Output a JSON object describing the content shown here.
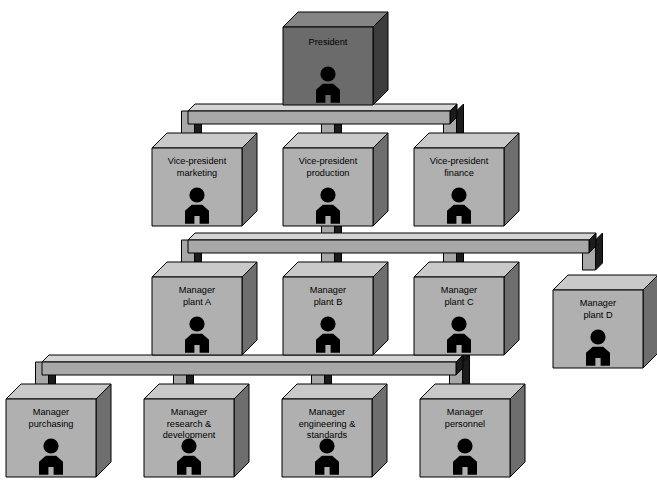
{
  "diagram": {
    "type": "hierarchy",
    "colors": {
      "box_front": "#b0b0b0",
      "box_top": "#c9c9c9",
      "box_side": "#6e6e6e",
      "root_front": "#6b6b6b",
      "root_top": "#848484",
      "root_side": "#3c3c3c",
      "beam_top": "#d4d4d4",
      "beam_front": "#a8a8a8",
      "beam_side": "#1c1c1c",
      "outline": "#000000",
      "person": "#000000",
      "background": "#ffffff"
    },
    "person_icon": "person-icon"
  },
  "nodes": {
    "president": {
      "id": "president",
      "lines": [
        "President"
      ],
      "level": 0,
      "style": "root"
    },
    "vp_marketing": {
      "id": "vp_marketing",
      "lines": [
        "Vice-president",
        "marketing"
      ],
      "level": 1,
      "style": "normal"
    },
    "vp_production": {
      "id": "vp_production",
      "lines": [
        "Vice-president",
        "production"
      ],
      "level": 1,
      "style": "normal"
    },
    "vp_finance": {
      "id": "vp_finance",
      "lines": [
        "Vice-president",
        "finance"
      ],
      "level": 1,
      "style": "normal"
    },
    "mgr_plant_a": {
      "id": "mgr_plant_a",
      "lines": [
        "Manager",
        "plant A"
      ],
      "level": 2,
      "style": "normal"
    },
    "mgr_plant_b": {
      "id": "mgr_plant_b",
      "lines": [
        "Manager",
        "plant B"
      ],
      "level": 2,
      "style": "normal"
    },
    "mgr_plant_c": {
      "id": "mgr_plant_c",
      "lines": [
        "Manager",
        "plant C"
      ],
      "level": 2,
      "style": "normal"
    },
    "mgr_plant_d": {
      "id": "mgr_plant_d",
      "lines": [
        "Manager",
        "plant D"
      ],
      "level": 2,
      "style": "normal"
    },
    "mgr_purchasing": {
      "id": "mgr_purchasing",
      "lines": [
        "Manager",
        "purchasing"
      ],
      "level": 3,
      "style": "normal"
    },
    "mgr_research": {
      "id": "mgr_research",
      "lines": [
        "Manager",
        "research &",
        "development"
      ],
      "level": 3,
      "style": "normal"
    },
    "mgr_engineering": {
      "id": "mgr_engineering",
      "lines": [
        "Manager",
        "engineering &",
        "standards"
      ],
      "level": 3,
      "style": "normal"
    },
    "mgr_personnel": {
      "id": "mgr_personnel",
      "lines": [
        "Manager",
        "personnel"
      ],
      "level": 3,
      "style": "normal"
    }
  },
  "layout": {
    "canvas": {
      "width": 657,
      "height": 486
    },
    "box": {
      "w": 90,
      "h": 78,
      "dx": 15,
      "dy": 15
    },
    "positions": {
      "president": {
        "x": 283,
        "y": 27
      },
      "vp_marketing": {
        "x": 152,
        "y": 148
      },
      "vp_production": {
        "x": 283,
        "y": 148
      },
      "vp_finance": {
        "x": 414,
        "y": 148
      },
      "mgr_plant_a": {
        "x": 152,
        "y": 277
      },
      "mgr_plant_b": {
        "x": 283,
        "y": 277
      },
      "mgr_plant_c": {
        "x": 414,
        "y": 277
      },
      "mgr_plant_d": {
        "x": 553,
        "y": 290
      },
      "mgr_purchasing": {
        "x": 6,
        "y": 399
      },
      "mgr_research": {
        "x": 144,
        "y": 399
      },
      "mgr_engineering": {
        "x": 282,
        "y": 399
      },
      "mgr_personnel": {
        "x": 420,
        "y": 399
      }
    },
    "beams": [
      {
        "id": "beam-level-1",
        "y": 111,
        "x1": 188,
        "x2": 450,
        "stem_x": 328,
        "children": [
          188,
          328,
          450
        ]
      },
      {
        "id": "beam-level-2",
        "y": 240,
        "x1": 188,
        "x2": 589,
        "stem_x": 328,
        "children": [
          188,
          328,
          450,
          589
        ]
      },
      {
        "id": "beam-level-3",
        "y": 362,
        "x1": 42,
        "x2": 456,
        "stem_x": 456,
        "children": [
          42,
          180,
          318,
          456
        ]
      }
    ]
  },
  "edges": [
    {
      "from": "president",
      "to": "vp_marketing"
    },
    {
      "from": "president",
      "to": "vp_production"
    },
    {
      "from": "president",
      "to": "vp_finance"
    },
    {
      "from": "vp_production",
      "to": "mgr_plant_a"
    },
    {
      "from": "vp_production",
      "to": "mgr_plant_b"
    },
    {
      "from": "vp_production",
      "to": "mgr_plant_c"
    },
    {
      "from": "vp_production",
      "to": "mgr_plant_d"
    },
    {
      "from": "mgr_plant_c",
      "to": "mgr_purchasing"
    },
    {
      "from": "mgr_plant_c",
      "to": "mgr_research"
    },
    {
      "from": "mgr_plant_c",
      "to": "mgr_engineering"
    },
    {
      "from": "mgr_plant_c",
      "to": "mgr_personnel"
    }
  ],
  "node_order": [
    "president",
    "vp_marketing",
    "vp_production",
    "vp_finance",
    "mgr_plant_a",
    "mgr_plant_b",
    "mgr_plant_c",
    "mgr_plant_d",
    "mgr_purchasing",
    "mgr_research",
    "mgr_engineering",
    "mgr_personnel"
  ]
}
